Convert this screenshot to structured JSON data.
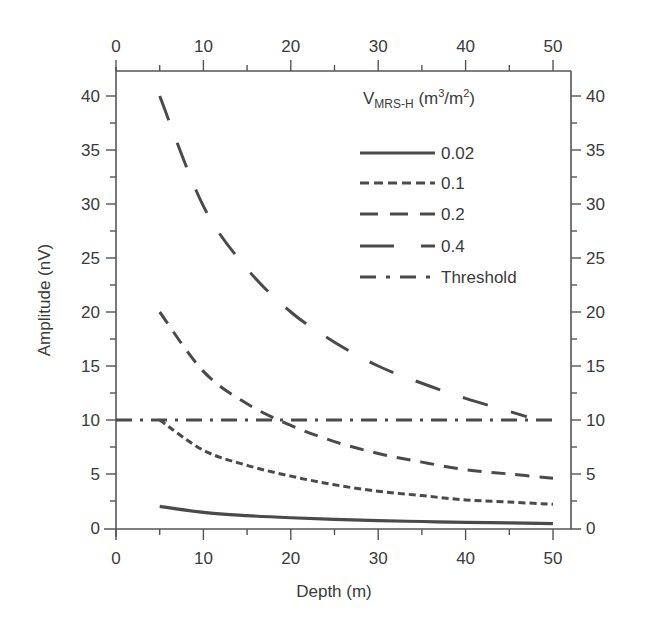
{
  "chart_data": {
    "type": "line",
    "title": "",
    "xlabel": "Depth (m)",
    "ylabel": "Amplitude (nV)",
    "xlim": [
      0,
      50
    ],
    "ylim": [
      0,
      40
    ],
    "xticks": [
      0,
      10,
      20,
      30,
      40,
      50
    ],
    "yticks": [
      0,
      5,
      10,
      15,
      20,
      25,
      30,
      35,
      40
    ],
    "x_minor_step": 5,
    "y_minor_step": 2.5,
    "grid": false,
    "mirrored_axes": "top x-axis and right y-axis repeat the same tick labels",
    "legend": {
      "title_main": "V",
      "title_sub": "MRS-H",
      "title_units": " (m3/m2)",
      "title_units_parts": [
        "(m",
        "3",
        "/m",
        "2",
        ")"
      ],
      "position": "upper right",
      "entries": [
        "0.02",
        "0.1",
        "0.2",
        "0.4",
        "Threshold"
      ]
    },
    "series": [
      {
        "name": "0.02",
        "style": "solid",
        "x": [
          5,
          10,
          15,
          20,
          25,
          30,
          35,
          40,
          45,
          50
        ],
        "values": [
          2.0,
          1.45,
          1.15,
          0.95,
          0.8,
          0.68,
          0.6,
          0.52,
          0.47,
          0.4
        ]
      },
      {
        "name": "0.1",
        "style": "short-dash",
        "x": [
          5,
          10,
          15,
          20,
          25,
          30,
          35,
          40,
          45,
          50
        ],
        "values": [
          10.0,
          7.2,
          5.8,
          4.8,
          4.0,
          3.4,
          3.0,
          2.6,
          2.4,
          2.2
        ]
      },
      {
        "name": "0.2",
        "style": "medium-dash",
        "x": [
          5,
          10,
          15,
          20,
          25,
          30,
          35,
          40,
          45,
          50
        ],
        "values": [
          20.0,
          14.5,
          11.5,
          9.5,
          8.0,
          6.9,
          6.1,
          5.4,
          5.0,
          4.6
        ]
      },
      {
        "name": "0.4",
        "style": "long-dash",
        "x": [
          5,
          10,
          15,
          20,
          25,
          30,
          35,
          40,
          45,
          47
        ],
        "values": [
          40.0,
          29.8,
          24.0,
          20.0,
          17.2,
          15.0,
          13.4,
          12.0,
          10.8,
          10.3
        ]
      },
      {
        "name": "Threshold",
        "style": "dash-dot",
        "x": [
          0,
          50
        ],
        "values": [
          10,
          10
        ]
      }
    ]
  }
}
